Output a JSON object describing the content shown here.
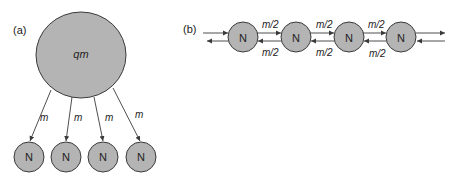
{
  "panel_a": {
    "label": "(a)",
    "hub": {
      "label": "qm"
    },
    "edges": [
      {
        "label": "m"
      },
      {
        "label": "m"
      },
      {
        "label": "m"
      },
      {
        "label": "m"
      }
    ],
    "nodes": [
      {
        "label": "N"
      },
      {
        "label": "N"
      },
      {
        "label": "N"
      },
      {
        "label": "N"
      }
    ]
  },
  "panel_b": {
    "label": "(b)",
    "nodes": [
      {
        "label": "N"
      },
      {
        "label": "N"
      },
      {
        "label": "N"
      },
      {
        "label": "N"
      }
    ],
    "forward_labels": [
      "m/2",
      "m/2",
      "m/2"
    ],
    "backward_labels": [
      "m/2",
      "m/2",
      "m/2"
    ]
  },
  "colors": {
    "node_fill": "#b4b4b4",
    "stroke": "#3a3a3a",
    "background": "#ffffff"
  }
}
